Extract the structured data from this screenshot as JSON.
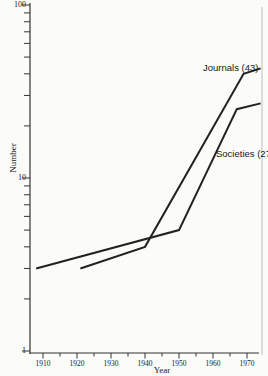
{
  "figure": {
    "background": "#fbfbf8",
    "line_color": "#222222",
    "axis_color": "#333333",
    "right_border_color": "#bcbcbc",
    "ylabel": "Number",
    "xlabel": "Year",
    "journals_label": "Journals (43)",
    "societies_label": "Societies (27)"
  },
  "chart_data": {
    "type": "line",
    "title": "",
    "xlabel": "Year",
    "ylabel": "Number",
    "y_scale": "log10",
    "ylim": [
      1,
      100
    ],
    "xlim": [
      1907,
      1975
    ],
    "grid": false,
    "legend_position": "inline-annotations",
    "x_ticks_major": [
      1910,
      1920,
      1930,
      1940,
      1950,
      1960,
      1970
    ],
    "x_ticks_minor": [
      1915,
      1925,
      1935,
      1945,
      1955,
      1965
    ],
    "y_ticks_major": [
      1,
      10,
      100
    ],
    "y_tick_labels": [
      "1",
      "10",
      "100"
    ],
    "y_ticks_minor": [
      2,
      3,
      4,
      5,
      6,
      7,
      8,
      9,
      20,
      30,
      40,
      50,
      60,
      70,
      80,
      90
    ],
    "series": [
      {
        "name": "Journals",
        "annotation": "Journals (43)",
        "points": [
          {
            "year": 1921,
            "value": 3
          },
          {
            "year": 1940,
            "value": 4
          },
          {
            "year": 1969,
            "value": 40
          },
          {
            "year": 1974,
            "value": 43
          }
        ]
      },
      {
        "name": "Societies",
        "annotation": "Societies (27)",
        "points": [
          {
            "year": 1908,
            "value": 3
          },
          {
            "year": 1950,
            "value": 5
          },
          {
            "year": 1967,
            "value": 25
          },
          {
            "year": 1974,
            "value": 27
          }
        ]
      }
    ]
  }
}
